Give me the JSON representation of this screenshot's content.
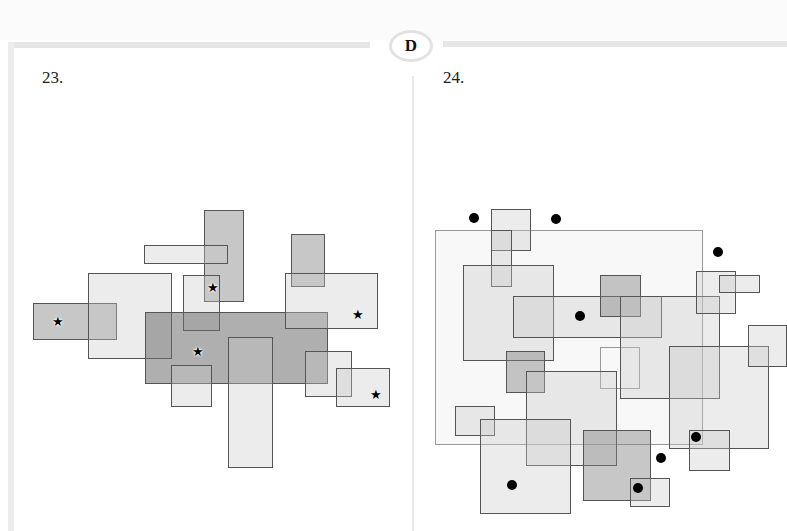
{
  "header": {
    "section_badge": "D"
  },
  "panels": [
    {
      "number": "23.",
      "rectangles": [
        {
          "x": 33,
          "y": 303,
          "w": 84,
          "h": 37,
          "shade": "mid"
        },
        {
          "x": 88,
          "y": 273,
          "w": 84,
          "h": 86,
          "shade": "light"
        },
        {
          "x": 204,
          "y": 210,
          "w": 40,
          "h": 92,
          "shade": "mid"
        },
        {
          "x": 144,
          "y": 245,
          "w": 84,
          "h": 19,
          "shade": "light"
        },
        {
          "x": 183,
          "y": 275,
          "w": 37,
          "h": 56,
          "shade": "light"
        },
        {
          "x": 145,
          "y": 312,
          "w": 183,
          "h": 72,
          "shade": "dark"
        },
        {
          "x": 171,
          "y": 365,
          "w": 41,
          "h": 42,
          "shade": "light"
        },
        {
          "x": 228,
          "y": 337,
          "w": 45,
          "h": 131,
          "shade": "light"
        },
        {
          "x": 291,
          "y": 234,
          "w": 34,
          "h": 53,
          "shade": "mid"
        },
        {
          "x": 285,
          "y": 273,
          "w": 93,
          "h": 56,
          "shade": "light"
        },
        {
          "x": 305,
          "y": 351,
          "w": 47,
          "h": 46,
          "shade": "light"
        },
        {
          "x": 336,
          "y": 368,
          "w": 54,
          "h": 39,
          "shade": "light"
        }
      ],
      "markers": [
        {
          "type": "star",
          "x": 58,
          "y": 322,
          "halo": true
        },
        {
          "type": "star",
          "x": 213,
          "y": 288,
          "halo": true
        },
        {
          "type": "star",
          "x": 198,
          "y": 352,
          "halo": true
        },
        {
          "type": "star",
          "x": 358,
          "y": 315,
          "halo": false
        },
        {
          "type": "star",
          "x": 376,
          "y": 395,
          "halo": false
        }
      ]
    },
    {
      "number": "24.",
      "rectangles": [
        {
          "x": 435,
          "y": 230,
          "w": 268,
          "h": 215,
          "shade": "frame"
        },
        {
          "x": 491,
          "y": 209,
          "w": 40,
          "h": 42,
          "shade": "light"
        },
        {
          "x": 491,
          "y": 230,
          "w": 21,
          "h": 57,
          "shade": "light"
        },
        {
          "x": 463,
          "y": 265,
          "w": 91,
          "h": 96,
          "shade": "light"
        },
        {
          "x": 513,
          "y": 296,
          "w": 149,
          "h": 42,
          "shade": "light"
        },
        {
          "x": 600,
          "y": 275,
          "w": 41,
          "h": 42,
          "shade": "mid"
        },
        {
          "x": 600,
          "y": 347,
          "w": 40,
          "h": 42,
          "shade": "none"
        },
        {
          "x": 620,
          "y": 296,
          "w": 100,
          "h": 103,
          "shade": "light"
        },
        {
          "x": 696,
          "y": 271,
          "w": 40,
          "h": 43,
          "shade": "light"
        },
        {
          "x": 719,
          "y": 275,
          "w": 41,
          "h": 18,
          "shade": "light"
        },
        {
          "x": 669,
          "y": 346,
          "w": 100,
          "h": 103,
          "shade": "light"
        },
        {
          "x": 748,
          "y": 325,
          "w": 39,
          "h": 42,
          "shade": "light"
        },
        {
          "x": 506,
          "y": 351,
          "w": 39,
          "h": 42,
          "shade": "mid"
        },
        {
          "x": 526,
          "y": 371,
          "w": 91,
          "h": 95,
          "shade": "light"
        },
        {
          "x": 455,
          "y": 406,
          "w": 40,
          "h": 30,
          "shade": "light"
        },
        {
          "x": 480,
          "y": 419,
          "w": 91,
          "h": 95,
          "shade": "light"
        },
        {
          "x": 583,
          "y": 430,
          "w": 68,
          "h": 71,
          "shade": "mid"
        },
        {
          "x": 630,
          "y": 478,
          "w": 40,
          "h": 29,
          "shade": "light"
        },
        {
          "x": 689,
          "y": 430,
          "w": 41,
          "h": 41,
          "shade": "light"
        }
      ],
      "markers": [
        {
          "type": "dot",
          "x": 474,
          "y": 218
        },
        {
          "type": "dot",
          "x": 556,
          "y": 219
        },
        {
          "type": "dot",
          "x": 718,
          "y": 252
        },
        {
          "type": "dot",
          "x": 580,
          "y": 316
        },
        {
          "type": "dot",
          "x": 696,
          "y": 437
        },
        {
          "type": "dot",
          "x": 661,
          "y": 458
        },
        {
          "type": "dot",
          "x": 512,
          "y": 485
        },
        {
          "type": "dot",
          "x": 638,
          "y": 488
        }
      ]
    }
  ],
  "icons": {
    "star": "★"
  }
}
